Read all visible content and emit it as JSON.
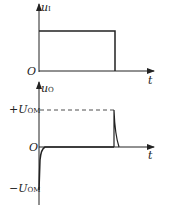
{
  "top_plot": {
    "y_label": "u",
    "y_label_sub": "I",
    "x_label": "t",
    "origin_label": "O",
    "waveform": "rectangular pulse",
    "pulse": {
      "start_x": 39,
      "end_x": 115,
      "level_y": 31
    }
  },
  "bottom_plot": {
    "y_label": "u",
    "y_label_sub": "O",
    "x_label": "t",
    "origin_label": "O",
    "pos_level_label": "+U",
    "pos_level_sub": "OM",
    "neg_level_label": "−U",
    "neg_level_sub": "OM",
    "waveform": "differentiator spikes: negative spike at rising edge, positive spike at falling edge"
  },
  "colors": {
    "line": "#222222",
    "background": "#ffffff"
  }
}
